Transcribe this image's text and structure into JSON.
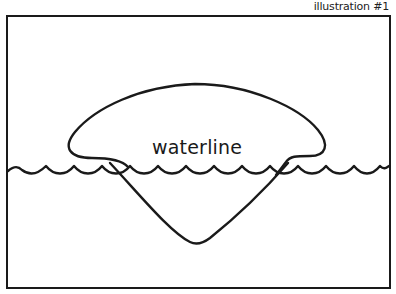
{
  "caption": "illustration #1",
  "diagram": {
    "label": "waterline",
    "shapes": [
      "frame",
      "waterline-wave",
      "iceberg-above-water",
      "iceberg-below-water"
    ],
    "stroke_color": "#1a1a1a",
    "background": "#ffffff"
  }
}
